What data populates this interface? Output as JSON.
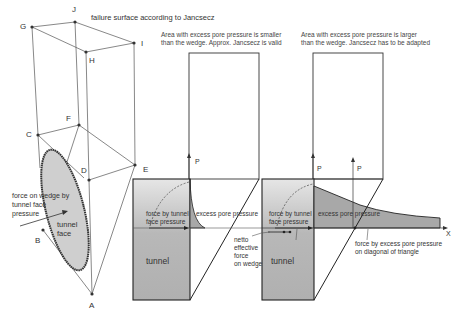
{
  "title": "failure surface according to Jancsecz",
  "wedge_3d": {
    "points": [
      "A",
      "B",
      "C",
      "D",
      "E",
      "F",
      "G",
      "H",
      "I",
      "J"
    ],
    "labels": {
      "tunnel_face": "tunnel face",
      "force_label": "force on wedge by tunnel face pressure"
    }
  },
  "panel_left": {
    "caption_line1": "Area with excess pore pressure is smaller",
    "caption_line2": "than the wedge. Approx. Jancsecz is valid",
    "p_label": "P",
    "force_tunnel_label_1": "force by tunnel",
    "force_tunnel_label_2": "face pressure",
    "excess_label": "excess pore pressure",
    "netto_1": "netto",
    "netto_2": "effective",
    "netto_3": "force",
    "netto_4": "on wedge",
    "tunnel_label": "tunnel"
  },
  "panel_right": {
    "caption_line1": "Area with excess pore pressure is larger",
    "caption_line2": "than the wedge. Jancsecz has to be adapted",
    "p_label_1": "P",
    "p_label_2": "P",
    "force_tunnel_label_1": "force by tunnel",
    "force_tunnel_label_2": "face pressure",
    "excess_label": "excess pore pressure",
    "x_label": "X",
    "diag_force_1": "force by excess pore pressure",
    "diag_force_2": "on diagonal of triangle",
    "tunnel_label": "tunnel"
  },
  "colors": {
    "line": "#444444",
    "tunnel_fill": "#b4b4b4",
    "pressure_fill": "#a8a8a8"
  }
}
